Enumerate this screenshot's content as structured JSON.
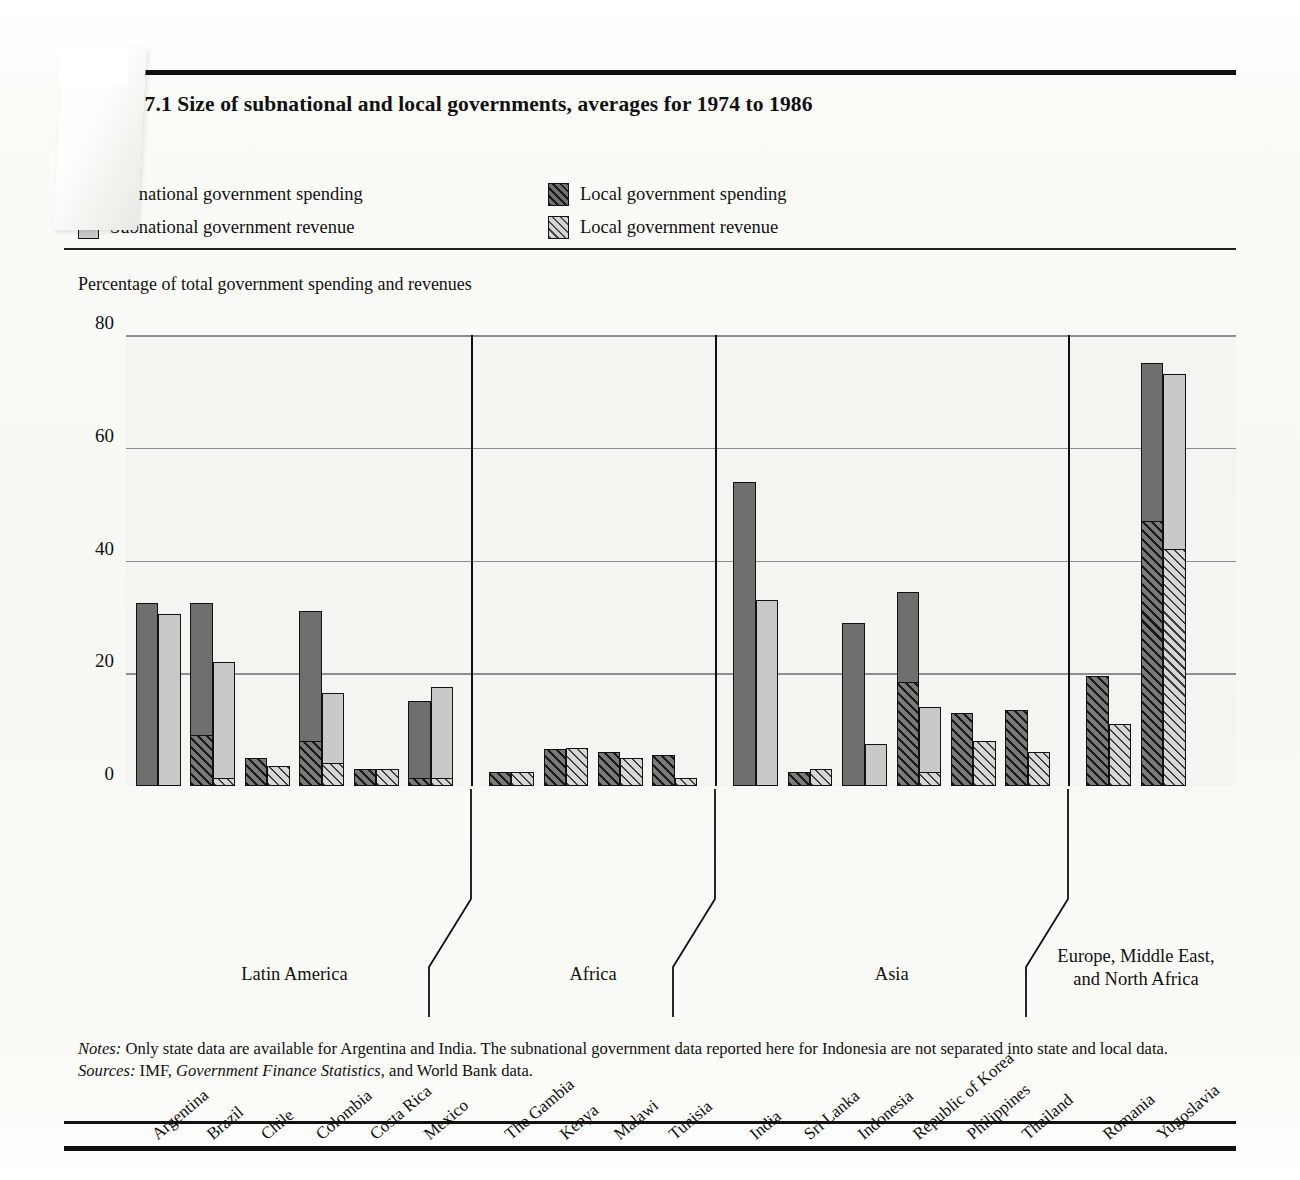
{
  "figure": {
    "title": "Figure 7.1  Size of subnational and local governments, averages for 1974 to 1986",
    "axis_caption": "Percentage of total government spending and revenues"
  },
  "legend": {
    "items": [
      {
        "label": "Subnational government spending",
        "swatch": "dark-solid-swatch"
      },
      {
        "label": "Local government spending",
        "swatch": "dark-hatched-swatch"
      },
      {
        "label": "Subnational government revenue",
        "swatch": "light-solid-swatch"
      },
      {
        "label": "Local government revenue",
        "swatch": "light-hatched-swatch"
      }
    ]
  },
  "notes": {
    "notes_label": "Notes:",
    "notes_text": " Only state data are available for Argentina and India. The subnational government data reported here for Indonesia are not separated into state and local data.",
    "sources_label": "Sources:",
    "sources_text_a": " IMF, ",
    "sources_italic": "Government Finance Statistics",
    "sources_text_b": ", and World Bank data."
  },
  "chart_data": {
    "type": "bar",
    "title": "Figure 7.1  Size of subnational and local governments, averages for 1974 to 1986",
    "xlabel": "",
    "ylabel": "Percentage of total government spending and revenues",
    "ylim": [
      0,
      80
    ],
    "yticks": [
      0,
      20,
      40,
      60,
      80
    ],
    "grid": true,
    "legend_position": "top",
    "categories": [
      "Argentina",
      "Brazil",
      "Chile",
      "Colombia",
      "Costa Rica",
      "Mexico",
      "The Gambia",
      "Kenya",
      "Malawi",
      "Tunisia",
      "India",
      "Sri Lanka",
      "Indonesia",
      "Republic of Korea",
      "Philippines",
      "Thailand",
      "Romania",
      "Yugoslavia"
    ],
    "series": [
      {
        "name": "Subnational government spending",
        "values": [
          32.5,
          32.5,
          5.0,
          31.0,
          3.0,
          15.0,
          2.5,
          6.5,
          6.0,
          5.5,
          54.0,
          2.5,
          29.0,
          34.5,
          13.0,
          13.5,
          19.5,
          75.0
        ]
      },
      {
        "name": "Local government spending",
        "values": [
          0.0,
          9.0,
          5.0,
          8.0,
          3.0,
          1.5,
          2.5,
          6.5,
          6.0,
          5.5,
          0.0,
          2.5,
          0.0,
          18.5,
          13.0,
          13.5,
          19.5,
          47.0
        ]
      },
      {
        "name": "Subnational government revenue",
        "values": [
          30.5,
          22.0,
          3.5,
          16.5,
          3.0,
          17.5,
          2.5,
          6.8,
          5.0,
          1.5,
          33.0,
          3.0,
          7.5,
          14.0,
          8.0,
          6.0,
          11.0,
          73.0
        ]
      },
      {
        "name": "Local government revenue",
        "values": [
          0.0,
          1.5,
          3.5,
          4.0,
          3.0,
          1.5,
          2.5,
          6.8,
          5.0,
          1.5,
          0.0,
          3.0,
          0.0,
          2.5,
          8.0,
          6.0,
          11.0,
          42.0
        ]
      }
    ],
    "groups": [
      {
        "label": "Latin America",
        "members": [
          "Argentina",
          "Brazil",
          "Chile",
          "Colombia",
          "Costa Rica",
          "Mexico"
        ]
      },
      {
        "label": "Africa",
        "members": [
          "The Gambia",
          "Kenya",
          "Malawi",
          "Tunisia"
        ]
      },
      {
        "label": "Asia",
        "members": [
          "India",
          "Sri Lanka",
          "Indonesia",
          "Republic of Korea",
          "Philippines",
          "Thailand"
        ]
      },
      {
        "label": "Europe, Middle East, and North Africa",
        "members": [
          "Romania",
          "Yugoslavia"
        ]
      }
    ],
    "group_labels": [
      "Latin America",
      "Africa",
      "Asia",
      "Europe, Middle East,\nand North Africa"
    ],
    "colors": {
      "spending_solid": "#6f6f6f",
      "revenue_solid": "#c9c9c9",
      "outline": "#111111",
      "plot_background": "#f4f4f0",
      "gridline": "#8e8e8e"
    }
  }
}
